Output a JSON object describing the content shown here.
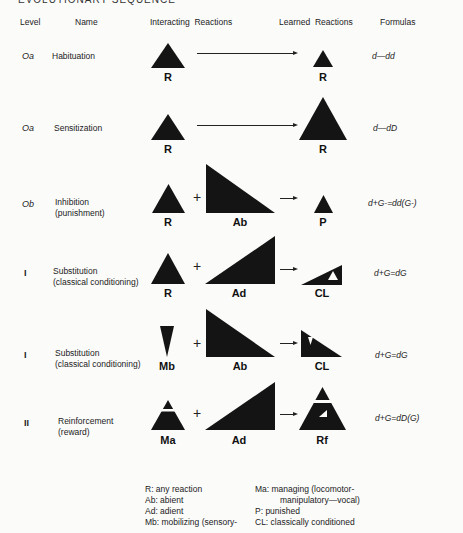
{
  "top_fragment": "EVOLUTIONARY SEQUENCE",
  "headers": {
    "level": "Level",
    "name": "Name",
    "interacting": "Interacting  Reactions",
    "learned": "Learned  Reactions",
    "formulas": "Formulas"
  },
  "rows": [
    {
      "level": "Oa",
      "name_line1": "Habituation",
      "name_line2": "",
      "interacting": [
        {
          "shape": "triangle-small",
          "label": "R"
        }
      ],
      "connector": "long-arrow",
      "learned": {
        "shape": "triangle-tiny",
        "label": "R"
      },
      "formula": "d—dd"
    },
    {
      "level": "Oa",
      "name_line1": "Sensitization",
      "name_line2": "",
      "interacting": [
        {
          "shape": "triangle-small",
          "label": "R"
        }
      ],
      "connector": "long-arrow",
      "learned": {
        "shape": "triangle-large",
        "label": "R"
      },
      "formula": "d—dD"
    },
    {
      "level": "Ob",
      "name_line1": "Inhibition",
      "name_line2": "(punishment)",
      "interacting": [
        {
          "shape": "triangle-small",
          "label": "R"
        },
        {
          "shape": "right-triangle-descending",
          "label": "Ab"
        }
      ],
      "operator": "+",
      "connector": "short-arrow",
      "learned": {
        "shape": "triangle-tiny",
        "label": "P"
      },
      "formula": "d+G-=dd(G-)"
    },
    {
      "level": "I",
      "name_line1": "Substitution",
      "name_line2": "(classical conditioning)",
      "interacting": [
        {
          "shape": "triangle-small",
          "label": "R"
        },
        {
          "shape": "right-triangle-ascending",
          "label": "Ad"
        }
      ],
      "operator": "+",
      "connector": "short-arrow",
      "learned": {
        "shape": "small-ascending-with-notch",
        "label": "CL"
      },
      "formula": "d+G=dG"
    },
    {
      "level": "I",
      "name_line1": "Substitution",
      "name_line2": "(classical conditioning)",
      "interacting": [
        {
          "shape": "inverted-triangle",
          "label": "Mb"
        },
        {
          "shape": "right-triangle-descending",
          "label": "Ab"
        }
      ],
      "operator": "+",
      "connector": "short-arrow",
      "learned": {
        "shape": "small-descending-with-notch",
        "label": "CL"
      },
      "formula": "d+G=dG"
    },
    {
      "level": "II",
      "name_line1": "Reinforcement",
      "name_line2": "(reward)",
      "interacting": [
        {
          "shape": "split-triangle",
          "label": "Ma"
        },
        {
          "shape": "right-triangle-ascending",
          "label": "Ad"
        }
      ],
      "operator": "+",
      "connector": "short-arrow",
      "learned": {
        "shape": "split-triangle-with-notch",
        "label": "Rf"
      },
      "formula": "d+G=dD(G)"
    }
  ],
  "legend": {
    "left": [
      "R: any reaction",
      "Ab: abient",
      "Ad: adient",
      "Mb: mobilizing (sensory-"
    ],
    "right": [
      "Ma: managing (locomotor-",
      "manipulatory—vocal)",
      "P: punished",
      "CL: classically conditioned"
    ]
  },
  "colors": {
    "ink": "#1a1a1a",
    "paper": "#fbfbfa"
  }
}
